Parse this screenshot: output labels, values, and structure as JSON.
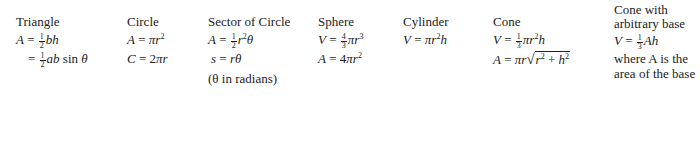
{
  "shapes": [
    {
      "id": "triangle",
      "title": "Triangle",
      "formulas": [
        "A = ½bh",
        "= ½ab sin θ"
      ],
      "labels": {
        "a": "a",
        "b": "b",
        "h": "h",
        "theta": "θ"
      }
    },
    {
      "id": "circle",
      "title": "Circle",
      "formulas": [
        "A = πr²",
        "C = 2πr"
      ],
      "labels": {
        "r": "r"
      }
    },
    {
      "id": "sector",
      "title": "Sector of Circle",
      "formulas": [
        "A = ½r²θ",
        "s = rθ"
      ],
      "note": "(θ in radians)",
      "labels": {
        "r1": "r",
        "r2": "r",
        "s": "s",
        "theta": "θ"
      }
    },
    {
      "id": "sphere",
      "title": "Sphere",
      "formulas": [
        "V = 4/3πr³",
        "A = 4πr²"
      ],
      "labels": {
        "r": "r"
      }
    },
    {
      "id": "cylinder",
      "title": "Cylinder",
      "formulas": [
        "V = πr²h"
      ],
      "labels": {
        "r": "r",
        "h": "h"
      }
    },
    {
      "id": "cone",
      "title": "Cone",
      "formulas": [
        "V = ⅓πr²h",
        "A = πr√(r² + h²)"
      ],
      "labels": {
        "r": "r",
        "h": "h"
      }
    },
    {
      "id": "cone-arbitrary",
      "title_line1": "Cone with",
      "title_line2": "arbitrary base",
      "formulas": [
        "V = ⅓Ah"
      ],
      "note_line1": "where A is the",
      "note_line2": "area of the base",
      "labels": {
        "h": "h"
      }
    }
  ]
}
